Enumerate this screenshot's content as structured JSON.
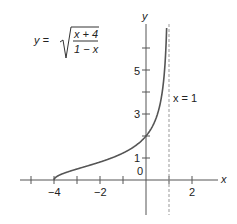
{
  "chart_data": {
    "type": "line",
    "title": "",
    "equation": {
      "lhs": "y =",
      "numerator": "x + 4",
      "denominator": "1 − x"
    },
    "xlabel": "x",
    "ylabel": "y",
    "xlim": [
      -5.5,
      3.3
    ],
    "ylim": [
      -1.6,
      7
    ],
    "x_ticks": [
      -5,
      -4,
      -3,
      -2,
      -1,
      1,
      2
    ],
    "x_tick_labels": [
      {
        "value": -4,
        "label": "−4"
      },
      {
        "value": -2,
        "label": "−2"
      },
      {
        "value": 2,
        "label": "2"
      }
    ],
    "y_ticks": [
      1,
      2,
      3,
      4,
      5,
      6
    ],
    "y_tick_labels": [
      {
        "value": 0,
        "label": "0"
      },
      {
        "value": 1,
        "label": "1"
      },
      {
        "value": 3,
        "label": "3"
      },
      {
        "value": 5,
        "label": "5"
      }
    ],
    "asymptote": {
      "type": "vertical",
      "x": 1,
      "label": "x = 1",
      "style": "dashed"
    },
    "series": [
      {
        "name": "y = sqrt((x+4)/(1-x))",
        "x": [
          -4,
          -3.9,
          -3.5,
          -3,
          -2,
          -1,
          0,
          0.5,
          0.8,
          0.9,
          0.95,
          0.97
        ],
        "y": [
          0,
          0.14,
          0.41,
          0.58,
          0.82,
          1.22,
          2.0,
          3.0,
          4.69,
          6.56,
          9.27,
          12.0
        ]
      }
    ],
    "grid": false,
    "legend": "none"
  }
}
